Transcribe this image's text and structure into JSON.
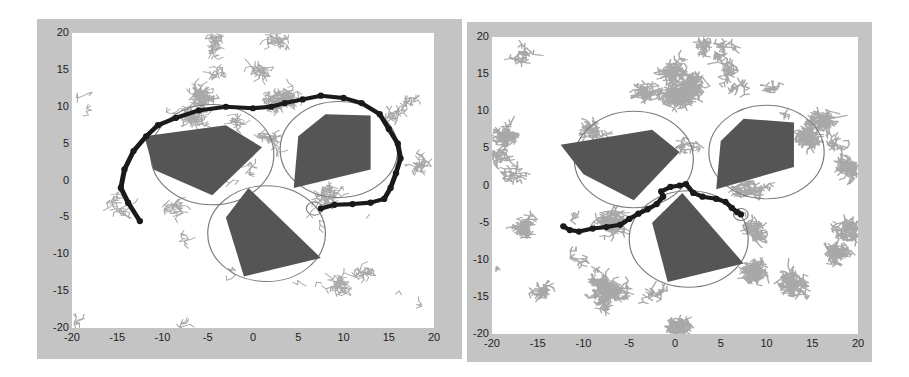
{
  "chart_data": [
    {
      "type": "scatter",
      "title": "",
      "xlabel": "",
      "ylabel": "",
      "xlim": [
        -20,
        20
      ],
      "ylim": [
        -20,
        20
      ],
      "xticks": [
        -20,
        -15,
        -10,
        -5,
        0,
        5,
        10,
        15,
        20
      ],
      "yticks": [
        20,
        15,
        10,
        5,
        0,
        -5,
        -10,
        -15,
        -20
      ],
      "tree_density": "sparse",
      "tree_nodes_approx": 1800,
      "obstacles": [
        [
          [
            -12,
            6
          ],
          [
            -3,
            7.5
          ],
          [
            1,
            4.5
          ],
          [
            -4.5,
            -2
          ],
          [
            -11,
            1.5
          ]
        ],
        [
          [
            8,
            9
          ],
          [
            13,
            8.8
          ],
          [
            13,
            1.5
          ],
          [
            4.5,
            -1
          ],
          [
            5,
            6
          ]
        ],
        [
          [
            -0.5,
            -1
          ],
          [
            7.5,
            -10.5
          ],
          [
            -1,
            -13
          ],
          [
            -3,
            -5
          ]
        ]
      ],
      "circles": [
        {
          "cx": -4.5,
          "cy": 3.5,
          "r": 6.8
        },
        {
          "cx": 9.5,
          "cy": 4.2,
          "r": 6.5
        },
        {
          "cx": 1.5,
          "cy": -7.2,
          "r": 6.5
        },
        {
          "cx": 6.8,
          "cy": -3.8,
          "r": 0.9
        }
      ],
      "path": [
        [
          -12.5,
          -5.5
        ],
        [
          -13.8,
          -3
        ],
        [
          -14.6,
          -1
        ],
        [
          -14.2,
          1.5
        ],
        [
          -13.2,
          4
        ],
        [
          -11.8,
          6
        ],
        [
          -10.5,
          7.5
        ],
        [
          -8.5,
          8.5
        ],
        [
          -6,
          9.5
        ],
        [
          -3,
          10
        ],
        [
          0,
          9.8
        ],
        [
          2,
          10
        ],
        [
          3.5,
          10.5
        ],
        [
          5.5,
          11
        ],
        [
          7.5,
          11.5
        ],
        [
          10,
          11.2
        ],
        [
          12,
          10.5
        ],
        [
          14,
          9
        ],
        [
          15,
          7
        ],
        [
          16,
          5
        ],
        [
          16.3,
          3
        ],
        [
          15.8,
          1
        ],
        [
          15.2,
          -1
        ],
        [
          14.5,
          -2.5
        ],
        [
          13,
          -3
        ],
        [
          11,
          -3.2
        ],
        [
          9,
          -3.3
        ],
        [
          7.5,
          -3.8
        ]
      ]
    },
    {
      "type": "scatter",
      "title": "",
      "xlabel": "",
      "ylabel": "",
      "xlim": [
        -20,
        20
      ],
      "ylim": [
        -20,
        20
      ],
      "xticks": [
        -20,
        -15,
        -10,
        -5,
        0,
        5,
        10,
        15,
        20
      ],
      "yticks": [
        20,
        15,
        10,
        5,
        0,
        -5,
        -10,
        -15,
        -20
      ],
      "tree_density": "dense",
      "tree_nodes_approx": 6000,
      "obstacles": [
        [
          [
            -12.5,
            5.5
          ],
          [
            -2.5,
            7.5
          ],
          [
            0.5,
            4.5
          ],
          [
            -4.5,
            -2
          ],
          [
            -10,
            1.5
          ]
        ],
        [
          [
            7.5,
            9
          ],
          [
            13,
            8.5
          ],
          [
            13,
            2.5
          ],
          [
            4.5,
            -0.5
          ],
          [
            5,
            6
          ]
        ],
        [
          [
            0.8,
            -1
          ],
          [
            7.5,
            -10.5
          ],
          [
            -0.8,
            -13
          ],
          [
            -2.5,
            -5
          ]
        ]
      ],
      "circles": [
        {
          "cx": -4.5,
          "cy": 3.5,
          "r": 6.5
        },
        {
          "cx": 10,
          "cy": 4.5,
          "r": 6.3
        },
        {
          "cx": 1.5,
          "cy": -7.2,
          "r": 6.5
        },
        {
          "cx": 7.2,
          "cy": -3.9,
          "r": 0.8
        }
      ],
      "path": [
        [
          -12.2,
          -5.5
        ],
        [
          -11.5,
          -6
        ],
        [
          -10.5,
          -6.2
        ],
        [
          -9,
          -5.8
        ],
        [
          -7.5,
          -5.6
        ],
        [
          -6,
          -5.3
        ],
        [
          -5,
          -4.5
        ],
        [
          -4,
          -3.8
        ],
        [
          -3,
          -3.2
        ],
        [
          -2,
          -2.5
        ],
        [
          -1.3,
          -1.5
        ],
        [
          -1.5,
          -0.8
        ],
        [
          -0.5,
          -0.2
        ],
        [
          0.5,
          0
        ],
        [
          1.2,
          0.2
        ],
        [
          2,
          -1
        ],
        [
          3,
          -1.5
        ],
        [
          4.5,
          -1.8
        ],
        [
          5.5,
          -2.2
        ],
        [
          6.2,
          -3
        ],
        [
          6.8,
          -3.6
        ],
        [
          7.2,
          -3.9
        ]
      ]
    }
  ],
  "colors": {
    "figure_bg": "#c4c4c4",
    "plot_bg": "#ffffff",
    "tree": "#a8a8a8",
    "obstacle": "#555555",
    "circle": "#7a7a7a",
    "path": "#1a1a1a"
  }
}
